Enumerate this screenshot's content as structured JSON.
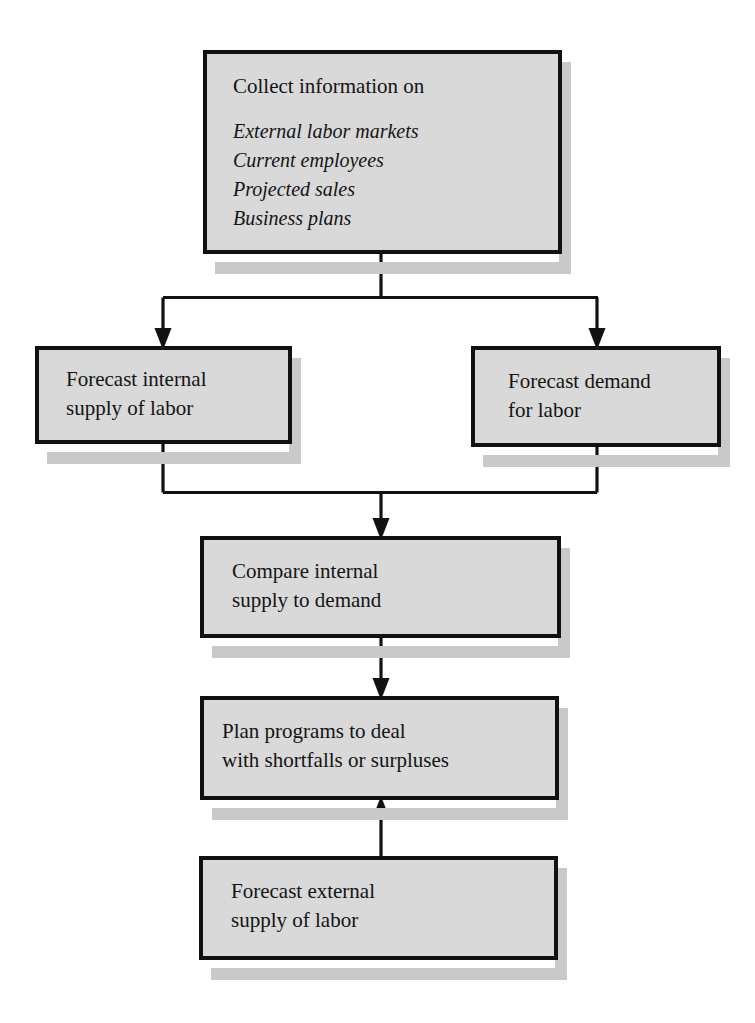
{
  "diagram": {
    "background_color": "#ffffff",
    "box_fill_color": "#d9d9d9",
    "box_border_color": "#111111",
    "shadow_color": "#c9c9c9",
    "text_color": "#141414",
    "nodes": [
      {
        "id": "collect-information",
        "heading": "Collect information on",
        "items": [
          "External labor markets",
          "Current employees",
          "Projected sales",
          "Business plans"
        ],
        "lines": []
      },
      {
        "id": "forecast-internal-supply",
        "heading": "",
        "items": [],
        "lines": [
          "Forecast internal",
          "supply of labor"
        ]
      },
      {
        "id": "forecast-demand",
        "heading": "",
        "items": [],
        "lines": [
          "Forecast demand",
          "for labor"
        ]
      },
      {
        "id": "compare-internal-supply",
        "heading": "",
        "items": [],
        "lines": [
          "Compare internal",
          "supply to demand"
        ]
      },
      {
        "id": "plan-programs",
        "heading": "",
        "items": [],
        "lines": [
          "Plan programs to deal",
          "with shortfalls or surpluses"
        ]
      },
      {
        "id": "forecast-external-supply",
        "heading": "",
        "items": [],
        "lines": [
          "Forecast external",
          "supply of labor"
        ]
      }
    ],
    "connectors": [
      {
        "id": "collect-to-split",
        "from": "collect-information",
        "to": "split-point",
        "direction": "down"
      },
      {
        "id": "split-to-internal-supply",
        "from": "split-point",
        "to": "forecast-internal-supply",
        "direction": "down"
      },
      {
        "id": "split-to-demand",
        "from": "split-point",
        "to": "forecast-demand",
        "direction": "down"
      },
      {
        "id": "internal-supply-to-merge",
        "from": "forecast-internal-supply",
        "to": "merge-point",
        "direction": "down"
      },
      {
        "id": "demand-to-merge",
        "from": "forecast-demand",
        "to": "merge-point",
        "direction": "down"
      },
      {
        "id": "merge-to-compare",
        "from": "merge-point",
        "to": "compare-internal-supply",
        "direction": "down"
      },
      {
        "id": "compare-to-plan",
        "from": "compare-internal-supply",
        "to": "plan-programs",
        "direction": "down"
      },
      {
        "id": "external-supply-to-plan",
        "from": "forecast-external-supply",
        "to": "plan-programs",
        "direction": "up"
      }
    ]
  }
}
